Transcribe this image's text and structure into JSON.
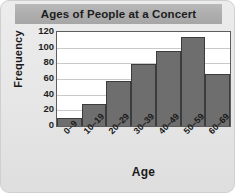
{
  "chart_data": {
    "type": "bar",
    "title": "Ages of People at a Concert",
    "xlabel": "Age",
    "ylabel": "Frequency",
    "categories": [
      "0–9",
      "10–19",
      "20–29",
      "30–39",
      "40–49",
      "50–59",
      "60–69"
    ],
    "values": [
      10,
      28,
      58,
      79,
      96,
      113,
      67
    ],
    "ylim": [
      0,
      120
    ],
    "yticks": [
      0,
      20,
      40,
      60,
      80,
      100,
      120
    ],
    "ytick_labels": [
      "0",
      "20",
      "40",
      "60",
      "80",
      "100",
      "120"
    ],
    "grid": true,
    "legend": false,
    "bar_color": "#6e6e6e",
    "bar_edge_color": "#3c3c3c",
    "plot_background": "#ffffff",
    "card_background": "#e8e8e8",
    "title_banner_color": "#aeaeae",
    "text_color": "#1a1a1a"
  }
}
